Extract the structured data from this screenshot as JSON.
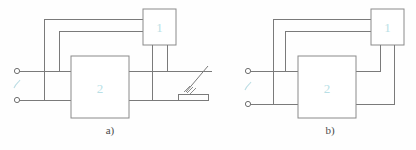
{
  "figure": {
    "type": "electrical-schematic",
    "background_color": "#fefefe",
    "line_color": "#7a7a7a",
    "block_label_color": "#b9dfe6",
    "caption_color": "#4a4a4a",
    "panels": [
      {
        "id": "a",
        "caption": "a)",
        "blocks": [
          {
            "id": "block-1",
            "label": "1"
          },
          {
            "id": "block-2",
            "label": "2"
          }
        ],
        "terminals": [
          {
            "id": "terminal-top",
            "shape": "open-circle"
          },
          {
            "id": "terminal-bottom",
            "shape": "open-circle"
          }
        ],
        "supply_symbol": "ac-tilde",
        "extra_elements": [
          {
            "id": "switch-contact",
            "kind": "hatched-contact"
          }
        ]
      },
      {
        "id": "b",
        "caption": "b)",
        "blocks": [
          {
            "id": "block-1",
            "label": "1"
          },
          {
            "id": "block-2",
            "label": "2"
          }
        ],
        "terminals": [
          {
            "id": "terminal-top",
            "shape": "open-circle"
          },
          {
            "id": "terminal-bottom",
            "shape": "open-circle"
          }
        ],
        "supply_symbol": "ac-tilde",
        "extra_elements": []
      }
    ]
  }
}
